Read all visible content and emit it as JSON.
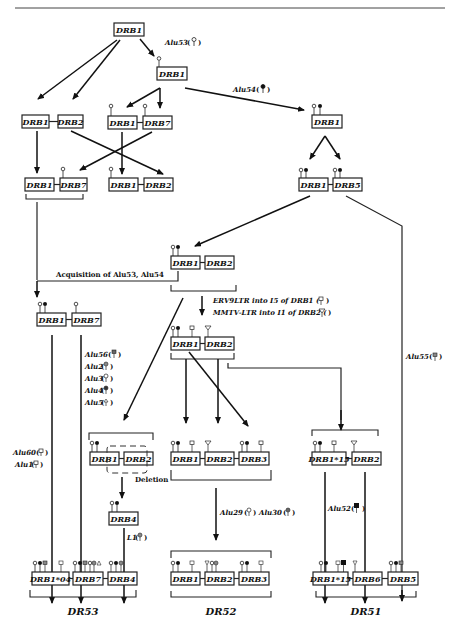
{
  "header_text": "",
  "nodes": {
    "root": "DRB1",
    "alu53_node": "DRB1",
    "left_pair_a": [
      "DRB1",
      "DRB2"
    ],
    "mid_pair_a": [
      "DRB1",
      "DRB7"
    ],
    "alu54_node": "DRB1",
    "left_pair_b": [
      "DRB1",
      "DRB7"
    ],
    "mid_pair_b": [
      "DRB1",
      "DRB2"
    ],
    "right_pair": [
      "DRB1",
      "DRB5"
    ],
    "center_pair": [
      "DRB1",
      "DRB2"
    ],
    "dr53_pre": [
      "DRB1",
      "DRB7"
    ],
    "ltr_pair": [
      "DRB1",
      "DRB2"
    ],
    "deletion_pair": [
      "DRB1",
      "DRB2"
    ],
    "drb4": "DRB4",
    "dr52_pre": [
      "DRB1",
      "DRB2",
      "DRB3"
    ],
    "dr51_pre": [
      "DRB1*15",
      "DRB2"
    ],
    "dr53_final": [
      "DRB1*04",
      "DRB7",
      "DRB4"
    ],
    "dr52_final": [
      "DRB1",
      "DRB2",
      "DRB3"
    ],
    "dr51_final": [
      "DRB1*15",
      "DRB6",
      "DRB5"
    ]
  },
  "labels": {
    "alu53": "Alu53",
    "alu54": "Alu54",
    "acquisition": "Acquisition of Alu53, Alu54",
    "erv9": "ERV9LTR  into I5 of DRB1 (",
    "mmtv": "MMTV-LTR  into I1 of DRB2 (",
    "alu56": "Alu56",
    "alu2": "Alu2",
    "alu3": "Alu3",
    "alu4": "Alu4",
    "alu5": "Alu5",
    "alu60": "Alu60",
    "alu1": "Alu1",
    "alu55": "Alu55",
    "deletion": "Deletion",
    "l1": "L1",
    "alu29": "Alu29",
    "alu30": "Alu30",
    "alu52": "Alu52"
  },
  "groups": {
    "dr53": "DR53",
    "dr52": "DR52",
    "dr51": "DR51"
  }
}
